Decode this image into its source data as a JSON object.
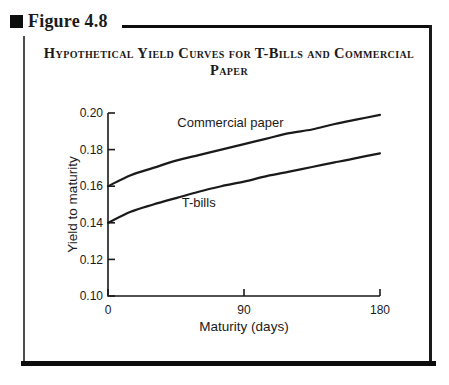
{
  "colors": {
    "ink": "#1a1a1a",
    "panel_border": "#4d4d4d",
    "heavy_bar": "#0d0d0d",
    "background": "#ffffff"
  },
  "figure": {
    "label": "Figure 4.8",
    "title_line1": "Hypothetical Yield Curves for T-Bills and Commercial",
    "title_line2": "Paper"
  },
  "chart_data": {
    "type": "line",
    "title": "Hypothetical Yield Curves for T-Bills and Commercial Paper",
    "xlabel": "Maturity (days)",
    "ylabel": "Yield to maturity",
    "xlim": [
      0,
      180
    ],
    "ylim": [
      0.1,
      0.2
    ],
    "x_ticks": [
      0,
      90,
      180
    ],
    "y_ticks": [
      0.1,
      0.12,
      0.14,
      0.16,
      0.18,
      0.2
    ],
    "grid": false,
    "legend_position": "inline-labels",
    "x": [
      0,
      15,
      30,
      45,
      60,
      75,
      90,
      105,
      120,
      135,
      150,
      165,
      180
    ],
    "series": [
      {
        "name": "Commercial paper",
        "values": [
          0.16,
          0.166,
          0.17,
          0.174,
          0.177,
          0.18,
          0.183,
          0.186,
          0.189,
          0.191,
          0.194,
          0.1965,
          0.199
        ],
        "label_anchor": {
          "day": 81,
          "value": 0.1925
        }
      },
      {
        "name": "T-bills",
        "values": [
          0.14,
          0.146,
          0.15,
          0.1535,
          0.157,
          0.16,
          0.1625,
          0.1655,
          0.168,
          0.1705,
          0.173,
          0.1755,
          0.178
        ],
        "label_anchor": {
          "day": 60,
          "value": 0.1485
        }
      }
    ]
  }
}
